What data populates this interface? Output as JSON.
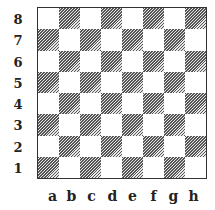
{
  "board": {
    "ranks": [
      "8",
      "7",
      "6",
      "5",
      "4",
      "3",
      "2",
      "1"
    ],
    "files": [
      "a",
      "b",
      "c",
      "d",
      "e",
      "f",
      "g",
      "h"
    ],
    "light_color": "#ffffff",
    "dark_style": "diagonal-hatch",
    "dark_color": "#555555",
    "a1_color": "dark",
    "pieces": []
  }
}
